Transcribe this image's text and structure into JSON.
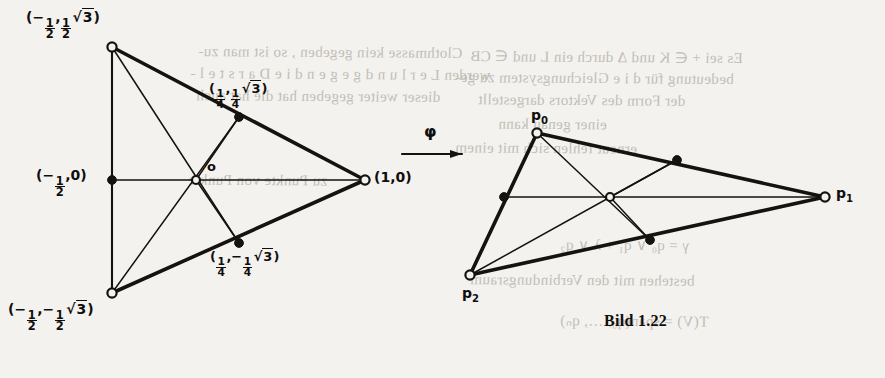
{
  "figure": {
    "caption": "Bild 1.22",
    "map_symbol": "φ"
  },
  "left_diagram": {
    "name": "equilateral-triangle-standard-position",
    "vertex_labels": {
      "top": "(−½, ½√3)",
      "bottom": "(−½, −½√3)",
      "right": "(1,0)",
      "mid_left": "(−½,0)",
      "mid_upper_right": "(¼, ¼√3)",
      "mid_lower_right": "(¼, −¼√3)",
      "origin": "o"
    },
    "parts": {
      "top_num": "1",
      "top_den": "2",
      "quarter_num": "1",
      "quarter_den": "4",
      "radicand": "3",
      "one_zero": "(1,0)",
      "origin": "o",
      "minus": "−",
      "lparen": "(",
      "rparen": ")",
      "comma": ","
    }
  },
  "right_diagram": {
    "name": "image-triangle-under-phi",
    "vertex_labels": {
      "p0_base": "p",
      "p0_sub": "0",
      "p1_base": "p",
      "p1_sub": "1",
      "p2_base": "p",
      "p2_sub": "2"
    }
  },
  "ghost_text": {
    "lines": [
      {
        "text": "Clothmasse kein gegeben , so ist man zu-",
        "x": 198,
        "y": 44,
        "size": 15
      },
      {
        "text": "werden L e r l u n d   g e g e n   d i e   D a r s t e l -",
        "x": 190,
        "y": 66,
        "size": 15
      },
      {
        "text": "dieser weiter gegeben  hat die hat auch",
        "x": 196,
        "y": 88,
        "size": 15
      },
      {
        "text": "Es sei  + ∈ K  und  ∆  durch ein L und ∈ CB",
        "x": 470,
        "y": 48,
        "size": 15
      },
      {
        "text": "bedeutung  für   d i e  Gleichungsystem zu ge-",
        "x": 455,
        "y": 70,
        "size": 15
      },
      {
        "text": "der   Form   des   Vektors   dargestellt",
        "x": 478,
        "y": 92,
        "size": 15
      },
      {
        "text": "einer  genau  kann",
        "x": 498,
        "y": 116,
        "size": 15
      },
      {
        "text": "erneut   fehlen  sich  mit  einem",
        "x": 455,
        "y": 140,
        "size": 15
      },
      {
        "text": "zu  Punkte  von  Punkte",
        "x": 188,
        "y": 172,
        "size": 15
      },
      {
        "text": "γ = q₀ ∨ q₁ + λ ∨ q₂",
        "x": 560,
        "y": 236,
        "size": 15
      },
      {
        "text": "bestehen  mit  den  Verbindungsraum",
        "x": 470,
        "y": 272,
        "size": 15
      },
      {
        "text": "T(V) = span(q₀, …, qₙ)",
        "x": 560,
        "y": 312,
        "size": 15
      }
    ]
  }
}
